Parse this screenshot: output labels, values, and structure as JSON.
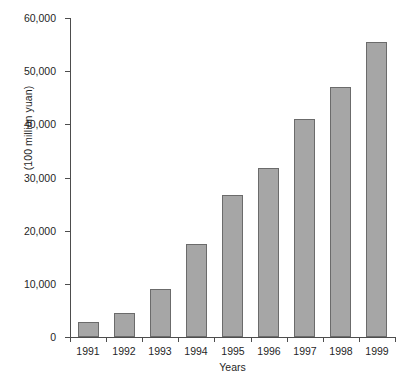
{
  "chart_data": {
    "type": "bar",
    "title": "",
    "xlabel": "Years",
    "ylabel": "(100 million yuan)",
    "categories": [
      "1991",
      "1992",
      "1993",
      "1994",
      "1995",
      "1996",
      "1997",
      "1998",
      "1999"
    ],
    "values": [
      2800,
      4500,
      9000,
      17500,
      26800,
      31800,
      41000,
      47000,
      55500
    ],
    "ylim": [
      0,
      60000
    ],
    "yticks": [
      0,
      10000,
      20000,
      30000,
      40000,
      50000,
      60000
    ],
    "ytick_labels": [
      "0",
      "10,000",
      "20,000",
      "30,000",
      "40,000",
      "50,000",
      "60,000"
    ],
    "grid": false,
    "legend": null,
    "bar_color": "#a6a6a6",
    "bar_border_color": "#6b6b6b",
    "axis_color": "#4d4d4d"
  }
}
